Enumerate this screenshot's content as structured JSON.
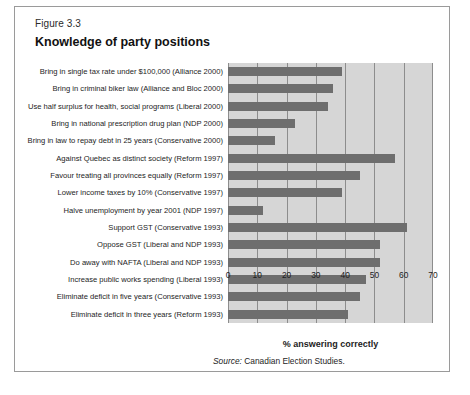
{
  "figure": {
    "number": "Figure 3.3",
    "title": "Knowledge of party positions",
    "source_lead": "Source:",
    "source_text": " Canadian Election Studies."
  },
  "colors": {
    "bar": "#6e6e6e",
    "plot_background": "#d6d6d6",
    "gridline": "#8d8d8d",
    "card_border": "#9a9a9a",
    "page_background": "#ffffff"
  },
  "chart_data": {
    "type": "bar",
    "orientation": "horizontal",
    "title": "Knowledge of party positions",
    "xlabel": "% answering correctly",
    "ylabel": "",
    "xlim": [
      0,
      70
    ],
    "xticks": [
      0,
      10,
      20,
      30,
      40,
      50,
      60,
      70
    ],
    "xtick_labels": [
      "0",
      "10",
      "20",
      "30",
      "40",
      "50",
      "60",
      "70"
    ],
    "grid": true,
    "legend": false,
    "categories": [
      "Bring in single tax rate under $100,000 (Alliance 2000)",
      "Bring in criminal biker law (Alliance and Bloc 2000)",
      "Use half surplus for health, social programs (Liberal  2000)",
      "Bring in national prescription drug plan (NDP  2000)",
      "Bring in law to repay debt in 25 years (Conservative  2000)",
      "Against Quebec as distinct society (Reform 1997)",
      "Favour treating all provinces equally (Reform 1997)",
      "Lower income taxes by 10% (Conservative 1997)",
      "Halve unemployment by year 2001 (NDP 1997)",
      "Support GST (Conservative 1993)",
      "Oppose GST (Liberal and NDP 1993)",
      "Do away with NAFTA (Liberal and NDP 1993)",
      "Increase public works spending (Liberal 1993)",
      "Eliminate deficit in five years (Conservative 1993)",
      "Eliminate deficit in three years (Reform 1993)"
    ],
    "values": [
      39,
      36,
      34,
      23,
      16,
      57,
      45,
      39,
      12,
      61,
      52,
      52,
      47,
      45,
      41
    ]
  }
}
